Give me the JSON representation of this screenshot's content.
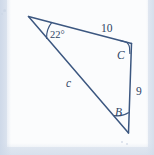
{
  "figure": {
    "kind": "triangle-diagram",
    "stroke_color": "#3c5780",
    "text_color": "#2f4464",
    "background_color": "#fbfcfd",
    "margin_color": "#dbe3ef",
    "vertices": {
      "A": {
        "x": 28,
        "y": 16,
        "label": ""
      },
      "C": {
        "x": 132,
        "y": 43,
        "label": "C"
      },
      "B": {
        "x": 128,
        "y": 133,
        "label": "B"
      }
    },
    "angle_labels": [
      {
        "name": "angle-A",
        "text": "22°",
        "x": 50,
        "y": 30
      },
      {
        "name": "vertex-C",
        "text": "C",
        "x": 117,
        "y": 50
      },
      {
        "name": "vertex-B",
        "text": "B",
        "x": 115,
        "y": 107
      }
    ],
    "side_labels": [
      {
        "name": "side-ac",
        "text": "10",
        "x": 101,
        "y": 23,
        "style": "number"
      },
      {
        "name": "side-cb",
        "text": "9",
        "x": 136,
        "y": 86,
        "style": "number"
      },
      {
        "name": "side-ab",
        "text": "c",
        "x": 66,
        "y": 78,
        "style": "variable"
      }
    ],
    "markers": [
      {
        "name": "angle-arc-a",
        "type": "arc"
      },
      {
        "name": "angle-arc-c",
        "type": "right-angle"
      },
      {
        "name": "angle-arc-b",
        "type": "arc"
      }
    ]
  }
}
